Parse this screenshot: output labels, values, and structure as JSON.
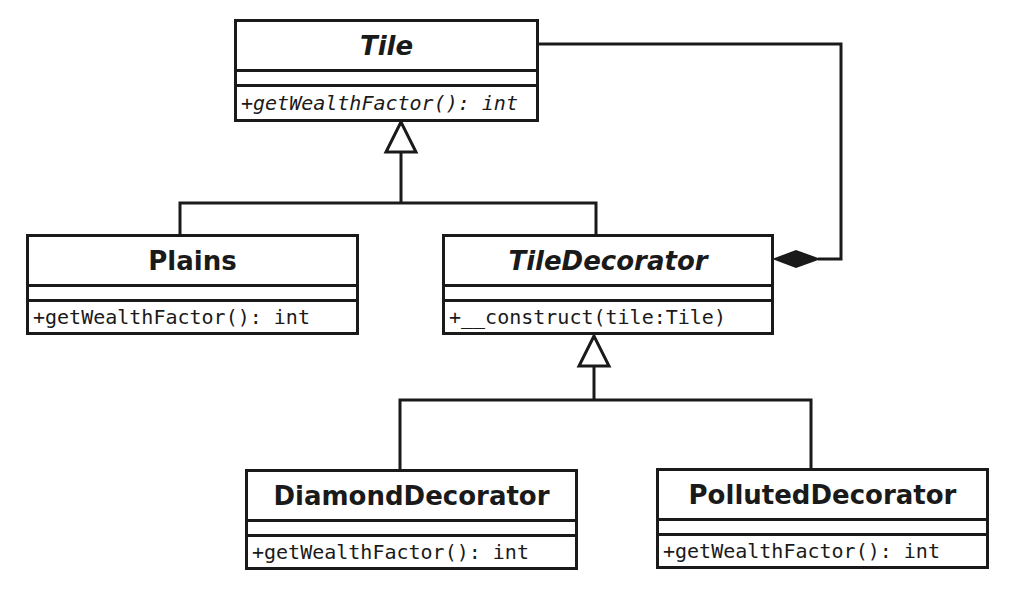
{
  "diagram": {
    "type": "UML class diagram",
    "pattern": "Decorator",
    "classes": {
      "tile": {
        "name": "Tile",
        "abstract": true,
        "operations": [
          "+getWealthFactor(): int"
        ]
      },
      "plains": {
        "name": "Plains",
        "abstract": false,
        "operations": [
          "+getWealthFactor(): int"
        ]
      },
      "tile_decorator": {
        "name": "TileDecorator",
        "abstract": true,
        "operations": [
          "+__construct(tile:Tile)"
        ]
      },
      "diamond_decorator": {
        "name": "DiamondDecorator",
        "abstract": false,
        "operations": [
          "+getWealthFactor(): int"
        ]
      },
      "polluted_decorator": {
        "name": "PollutedDecorator",
        "abstract": false,
        "operations": [
          "+getWealthFactor(): int"
        ]
      }
    },
    "relationships": [
      {
        "type": "generalization",
        "from": "Plains",
        "to": "Tile"
      },
      {
        "type": "generalization",
        "from": "TileDecorator",
        "to": "Tile"
      },
      {
        "type": "generalization",
        "from": "DiamondDecorator",
        "to": "TileDecorator"
      },
      {
        "type": "generalization",
        "from": "PollutedDecorator",
        "to": "TileDecorator"
      },
      {
        "type": "composition",
        "whole": "TileDecorator",
        "part": "Tile"
      }
    ],
    "colors": {
      "line": "#1a1a1a",
      "fill": "#ffffff",
      "background": "#ffffff"
    }
  }
}
